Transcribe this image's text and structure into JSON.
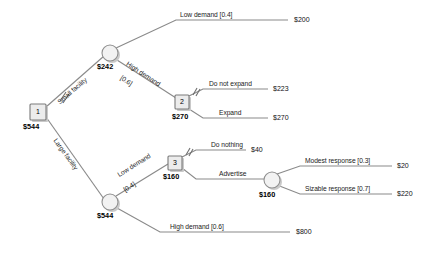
{
  "diagram": {
    "type": "decision-tree",
    "colors": {
      "edge": "#8a8a8a",
      "decision_node_fill": "#ececec",
      "chance_node_fill": "#f2f2f2",
      "node_stroke": "#7a7a7a",
      "text": "#111111"
    }
  },
  "nodes": {
    "d1": {
      "id": "1",
      "kind": "decision",
      "value": "$544"
    },
    "c_small": {
      "kind": "chance",
      "value": "$242"
    },
    "d2": {
      "id": "2",
      "kind": "decision",
      "value": "$270"
    },
    "c_large": {
      "kind": "chance",
      "value": "$544"
    },
    "d3": {
      "id": "3",
      "kind": "decision",
      "value": "$160"
    },
    "c_ad": {
      "kind": "chance",
      "value": "$160"
    }
  },
  "branches": {
    "small_facility": {
      "label": "Small facility",
      "pruned": true
    },
    "large_facility": {
      "label": "Large facility",
      "pruned": false
    },
    "low_demand_small": {
      "label": "Low demand [0.4]",
      "probability": 0.4
    },
    "high_demand_small": {
      "label_line1": "High demand",
      "label_line2": "[0.6]",
      "probability": 0.6
    },
    "do_not_expand": {
      "label": "Do not expand",
      "pruned": true
    },
    "expand": {
      "label": "Expand",
      "pruned": false
    },
    "low_demand_large": {
      "label_line1": "Low demand",
      "label_line2": "[0.4]",
      "probability": 0.4
    },
    "high_demand_large": {
      "label": "High demand [0.6]",
      "probability": 0.6
    },
    "do_nothing": {
      "label": "Do nothing",
      "pruned": true
    },
    "advertise": {
      "label": "Advertise",
      "pruned": false
    },
    "modest_response": {
      "label": "Modest response [0.3]",
      "probability": 0.3
    },
    "sizable_response": {
      "label": "Sizable response [0.7]",
      "probability": 0.7
    }
  },
  "payoffs": {
    "low_demand_small": "$200",
    "do_not_expand": "$223",
    "expand": "$270",
    "do_nothing": "$40",
    "modest_response": "$20",
    "sizable_response": "$220",
    "high_demand_large": "$800"
  }
}
